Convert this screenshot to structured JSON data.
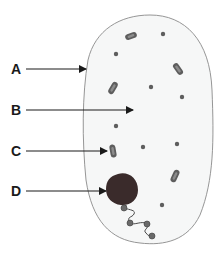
{
  "diagram": {
    "type": "cell-diagram",
    "labels": [
      {
        "id": "A",
        "text": "A",
        "x": 15,
        "y": 69,
        "target": "cell-membrane",
        "arrow_end": [
          86,
          69
        ]
      },
      {
        "id": "B",
        "text": "B",
        "x": 15,
        "y": 110,
        "target": "cytoplasm",
        "arrow_end": [
          133,
          110
        ]
      },
      {
        "id": "C",
        "text": "C",
        "x": 15,
        "y": 151,
        "target": "mitochondrion",
        "arrow_end": [
          107,
          151
        ]
      },
      {
        "id": "D",
        "text": "D",
        "x": 15,
        "y": 191,
        "target": "nucleus",
        "arrow_end": [
          106,
          191
        ]
      }
    ],
    "colors": {
      "cell_fill": "#f6f7f7",
      "cell_outline": "#8a8a8a",
      "organelle": "#5e5e5e",
      "organelle_highlight": "#8c8c8c",
      "nucleus": "#3a2b2b",
      "arrow": "#1a1a1a",
      "label": "#1a1a1a"
    }
  }
}
